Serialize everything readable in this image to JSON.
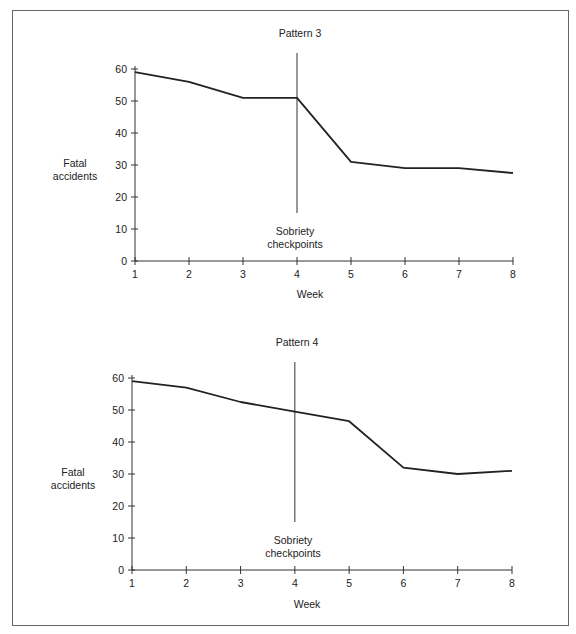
{
  "chart_data": [
    {
      "type": "line",
      "title": "Pattern 3",
      "xlabel": "Week",
      "ylabel": "Fatal accidents",
      "categories": [
        1,
        2,
        3,
        4,
        5,
        6,
        7,
        8
      ],
      "values": [
        59,
        56,
        51,
        51,
        31,
        29,
        29,
        27.5
      ],
      "ylim": [
        0,
        60
      ],
      "yticks": [
        0,
        10,
        20,
        30,
        40,
        50,
        60
      ],
      "xticks": [
        1,
        2,
        3,
        4,
        5,
        6,
        7,
        8
      ],
      "grid": false,
      "legend": null,
      "annotation": {
        "x": 4,
        "label": "Sobriety checkpoints",
        "type": "vertical-line"
      }
    },
    {
      "type": "line",
      "title": "Pattern 4",
      "xlabel": "Week",
      "ylabel": "Fatal accidents",
      "categories": [
        1,
        2,
        3,
        4,
        5,
        6,
        7,
        8
      ],
      "values": [
        59,
        57,
        52.5,
        49.5,
        46.5,
        32,
        30,
        31
      ],
      "ylim": [
        0,
        60
      ],
      "yticks": [
        0,
        10,
        20,
        30,
        40,
        50,
        60
      ],
      "xticks": [
        1,
        2,
        3,
        4,
        5,
        6,
        7,
        8
      ],
      "grid": false,
      "legend": null,
      "annotation": {
        "x": 4,
        "label": "Sobriety checkpoints",
        "type": "vertical-line"
      }
    }
  ],
  "charts": [
    {
      "title": "Pattern 3",
      "ylabel_line1": "Fatal",
      "ylabel_line2": "accidents",
      "xlabel": "Week",
      "annotation_line1": "Sobriety",
      "annotation_line2": "checkpoints"
    },
    {
      "title": "Pattern 4",
      "ylabel_line1": "Fatal",
      "ylabel_line2": "accidents",
      "xlabel": "Week",
      "annotation_line1": "Sobriety",
      "annotation_line2": "checkpoints"
    }
  ]
}
